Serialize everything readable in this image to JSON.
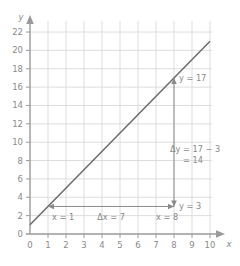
{
  "chart_data": {
    "type": "line",
    "title": "",
    "xlabel": "x",
    "ylabel": "y",
    "xlim": [
      0,
      10
    ],
    "ylim": [
      0,
      23
    ],
    "xticks": [
      "0",
      "1",
      "2",
      "3",
      "4",
      "5",
      "6",
      "7",
      "8",
      "9",
      "10"
    ],
    "yticks": [
      "0",
      "2",
      "4",
      "6",
      "8",
      "10",
      "12",
      "14",
      "16",
      "18",
      "20",
      "22"
    ],
    "xtick_values": [
      0,
      1,
      2,
      3,
      4,
      5,
      6,
      7,
      8,
      9,
      10
    ],
    "ytick_values": [
      0,
      2,
      4,
      6,
      8,
      10,
      12,
      14,
      16,
      18,
      20,
      22
    ],
    "grid": true,
    "legend": "none",
    "series": [
      {
        "name": "line",
        "x": [
          0,
          10
        ],
        "y": [
          1,
          21
        ],
        "slope": 2,
        "intercept": 1,
        "color": "#6b6b6b"
      }
    ],
    "points": [
      {
        "label": "point-1",
        "x": 1,
        "y": 3
      },
      {
        "label": "point-2",
        "x": 8,
        "y": 17
      }
    ],
    "annotations": {
      "x1_label": "x = 1",
      "x2_label": "x = 8",
      "y1_label": "y = 3",
      "y2_label": "y = 17",
      "delta_x_label": "Δx = 7",
      "delta_y_line1": "Δy = 17 − 3",
      "delta_y_line2": "= 14",
      "delta_x_value": 7,
      "delta_y_value": 14
    },
    "colors": {
      "grid": "#d9d9d9",
      "axis": "#9a9a9a",
      "line": "#6b6b6b",
      "annotation": "#8a8a8a",
      "text": "#8a8a8a",
      "background": "#ffffff"
    }
  },
  "axis_titles": {
    "x": "x",
    "y": "y"
  }
}
